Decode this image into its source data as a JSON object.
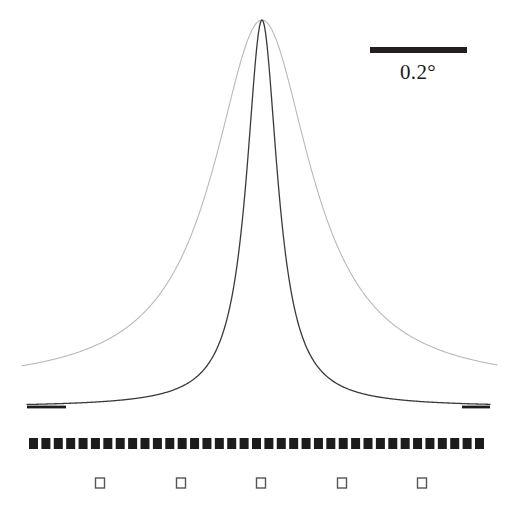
{
  "figure": {
    "background_color": "#ffffff",
    "scalebar": {
      "label": "0.2°",
      "bar_color": "#231f20",
      "x_start": 370,
      "x_end": 467,
      "y": 47,
      "thickness": 6,
      "label_x": 418,
      "label_y": 60
    },
    "tick_rows": [
      {
        "name": "filled-square-ticks",
        "style": "filled",
        "color": "#1c1c1c",
        "count": 37,
        "x_start": 29,
        "x_end": 484,
        "y": 438,
        "size_w": 9,
        "size_h": 11
      },
      {
        "name": "open-square-ticks",
        "style": "open",
        "color": "#555555",
        "count": 5,
        "positions": [
          100,
          181,
          261,
          342,
          422
        ],
        "y": 478,
        "size_w": 9,
        "size_h": 10,
        "stroke": 1.4
      }
    ]
  },
  "chart_data": {
    "type": "line",
    "title": "",
    "xlabel": "",
    "ylabel": "",
    "grid": false,
    "legend": "none",
    "axis_note": "Horizontal axis is rocking-curve angle; scale bar denotes 0.2 degrees. Vertical axis is diffracted intensity (arbitrary units, unlabeled).",
    "x_units": "degree",
    "peak_center_px": 262,
    "peak_top_px": 20,
    "xlim_px": [
      22,
      497
    ],
    "series": [
      {
        "name": "broad-curve",
        "role": "broad rocking curve",
        "color": "#b9b9b9",
        "stroke_width": 1.1,
        "peak_center_px": 262,
        "peak_top_px": 20,
        "baseline_px": 387,
        "fwhm_px": 119,
        "fwhm_deg": 0.245,
        "x_start_px": 22,
        "x_end_px": 497,
        "shape": "lorentzian",
        "lorentz_exponent": 1.0
      },
      {
        "name": "narrow-curve",
        "role": "narrow rocking curve",
        "color": "#3a3a3a",
        "stroke_width": 1.3,
        "peak_center_px": 262,
        "peak_top_px": 20,
        "baseline_px": 407,
        "fwhm_px": 38,
        "fwhm_deg": 0.078,
        "x_start_px": 27,
        "x_end_px": 490,
        "shape": "lorentzian",
        "lorentz_exponent": 1.0,
        "thick_tail_segments": [
          {
            "x_start": 27,
            "x_end": 66
          },
          {
            "x_start": 462,
            "x_end": 490
          }
        ]
      }
    ],
    "scale": {
      "bar_label": "0.2°",
      "bar_length_px": 97,
      "deg_per_px": 0.00206
    }
  }
}
